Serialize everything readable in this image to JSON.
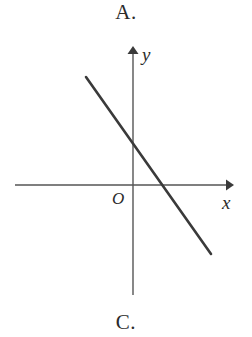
{
  "labels": {
    "top_choice": "A.",
    "bottom_choice": "C."
  },
  "diagram": {
    "name": "cartesian-plane-with-decreasing-line",
    "axis_color": "#555555",
    "line_color": "#3a3a3a",
    "background_color": "#ffffff",
    "x_axis_label": "x",
    "y_axis_label": "y",
    "origin_label": "O",
    "x_axis": {
      "start_x": 15,
      "end_x": 234,
      "y": 155,
      "arrow": "right"
    },
    "y_axis": {
      "x": 133,
      "start_y": 265,
      "end_y": 16,
      "arrow": "up"
    },
    "line": {
      "x1": 86,
      "y1": 47,
      "x2": 211,
      "y2": 224,
      "slope_sign": "negative",
      "y_intercept_sign": "positive",
      "x_intercept_sign": "positive",
      "y_intercept_point": [
        133,
        115
      ],
      "x_intercept_point": [
        160,
        155
      ]
    }
  }
}
